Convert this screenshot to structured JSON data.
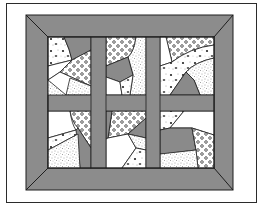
{
  "figure": {
    "colors": {
      "background": "#ffffff",
      "frame_line": "#2b2b2b",
      "border_fill": "#8c8c8c",
      "sashing_fill": "#8c8c8c",
      "patch_gray": "#8a8a8a",
      "patch_white": "#ffffff",
      "outline": "#1e1e1e",
      "print_dots": "#333333"
    },
    "layout": {
      "frame": {
        "x": 6,
        "y": 3,
        "w": 251,
        "h": 200
      },
      "border_outer": {
        "x": 26,
        "y": 15,
        "w": 207,
        "h": 175
      },
      "border_inner": {
        "x": 48,
        "y": 37,
        "w": 166,
        "h": 131
      },
      "rows": 2,
      "cols": 3
    },
    "blocks": [
      {
        "id": "block-top-left",
        "row": 1,
        "col": 1
      },
      {
        "id": "block-top-middle",
        "row": 1,
        "col": 2
      },
      {
        "id": "block-top-right",
        "row": 1,
        "col": 3
      },
      {
        "id": "block-bottom-left",
        "row": 2,
        "col": 1
      },
      {
        "id": "block-bottom-middle",
        "row": 2,
        "col": 2
      },
      {
        "id": "block-bottom-right",
        "row": 2,
        "col": 3
      }
    ],
    "fabric_prints": [
      "solid-gray",
      "solid-white",
      "polka-dot",
      "speckled",
      "floral-print"
    ]
  }
}
